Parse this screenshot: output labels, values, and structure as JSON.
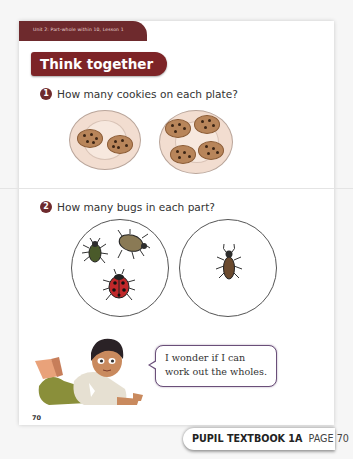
{
  "header": {
    "unit_label": "Unit 2: Part-whole within 10, Lesson 1",
    "section_title": "Think together"
  },
  "questions": [
    {
      "number": "1",
      "text": "How many cookies on each plate?",
      "plates": [
        {
          "cookies": 2
        },
        {
          "cookies": 4
        }
      ]
    },
    {
      "number": "2",
      "text": "How many bugs in each part?",
      "parts": [
        {
          "bugs": 3
        },
        {
          "bugs": 1
        }
      ]
    }
  ],
  "character": {
    "speech": [
      "I wonder if I can",
      "work out the wholes."
    ]
  },
  "footer": {
    "page_number": "70",
    "book_label": "PUPIL TEXTBOOK 1A",
    "page_label": "PAGE 70"
  },
  "colors": {
    "accent": "#7d2427",
    "header_band": "#6e2a2d",
    "bubble_border": "#6a4f79"
  }
}
